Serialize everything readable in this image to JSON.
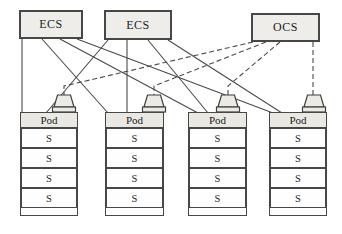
{
  "diagram": {
    "top_nodes": [
      {
        "id": "ECS-1",
        "label": "ECS"
      },
      {
        "id": "ECS-2",
        "label": "ECS"
      },
      {
        "id": "OCS-1",
        "label": "OCS"
      }
    ],
    "pods": [
      {
        "header": "Pod",
        "servers": [
          "S",
          "S",
          "S",
          "S"
        ]
      },
      {
        "header": "Pod",
        "servers": [
          "S",
          "S",
          "S",
          "S"
        ]
      },
      {
        "header": "Pod",
        "servers": [
          "S",
          "S",
          "S",
          "S"
        ]
      },
      {
        "header": "Pod",
        "servers": [
          "S",
          "S",
          "S",
          "S"
        ]
      }
    ],
    "edges": {
      "solid": [
        {
          "from": "ECS-1",
          "to": "Pod-1"
        },
        {
          "from": "ECS-1",
          "to": "Pod-2"
        },
        {
          "from": "ECS-1",
          "to": "Pod-3"
        },
        {
          "from": "ECS-1",
          "to": "Pod-4"
        },
        {
          "from": "ECS-2",
          "to": "Pod-1"
        },
        {
          "from": "ECS-2",
          "to": "Pod-2"
        },
        {
          "from": "ECS-2",
          "to": "Pod-3"
        },
        {
          "from": "ECS-2",
          "to": "Pod-4"
        }
      ],
      "dashed": [
        {
          "from": "OCS-1",
          "to": "Pod-1"
        },
        {
          "from": "OCS-1",
          "to": "Pod-2"
        },
        {
          "from": "OCS-1",
          "to": "Pod-3"
        },
        {
          "from": "OCS-1",
          "to": "Pod-4"
        }
      ]
    },
    "colors": {
      "background": "#ffffff",
      "box_fill": "#eeedea",
      "pod_header_fill": "#e9e8e3",
      "border": "#474747",
      "line": "#4a4a4a"
    }
  }
}
